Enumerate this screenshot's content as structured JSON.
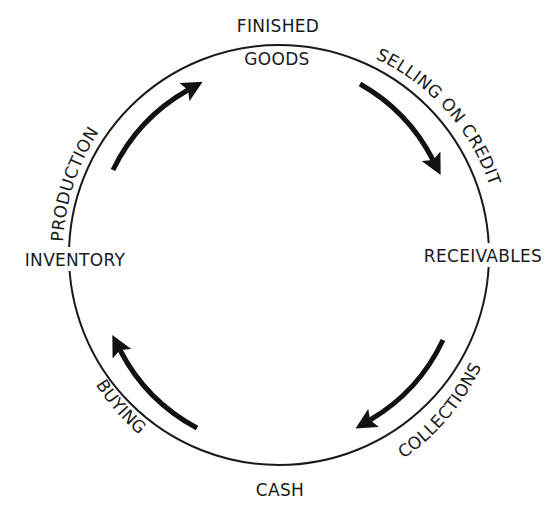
{
  "diagram": {
    "ring_color": "#1a1a1a",
    "arrow_color": "#111111",
    "background": "#ffffff",
    "nodes": {
      "finished_goods_line1": "FINISHED",
      "finished_goods_line2": "GOODS",
      "receivables": "RECEIVABLES",
      "cash": "CASH",
      "inventory": "INVENTORY"
    },
    "flows": {
      "production": "PRODUCTION",
      "selling_on_credit": "SELLING ON CREDIT",
      "collections": "COLLECTIONS",
      "buying": "BUYING"
    },
    "cycle_order": [
      "INVENTORY",
      "PRODUCTION",
      "FINISHED GOODS",
      "SELLING ON CREDIT",
      "RECEIVABLES",
      "COLLECTIONS",
      "CASH",
      "BUYING"
    ],
    "arrow_direction": "clockwise"
  }
}
